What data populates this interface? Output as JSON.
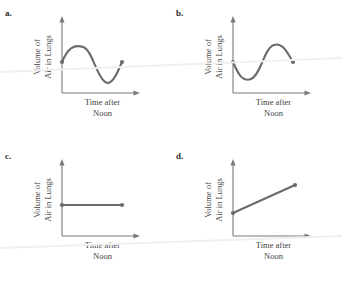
{
  "figure": {
    "background": "#ffffff",
    "stroke_color": "#6b6b6b",
    "axis_color": "#7a7a7a",
    "text_color": "#3f3f3f",
    "letter_color": "#2a2a2a",
    "artifact_color": "#f2f0ee"
  },
  "axis_labels": {
    "y_line1": "Volume of",
    "y_line2": "Air in Lungs",
    "x_line1": "Time after",
    "x_line2": "Noon"
  },
  "panels": [
    {
      "letter": "a.",
      "name": "panel-a",
      "curve_type": "sine-up-first",
      "description": "Curve starts at a dot on the vertical axis, rises to a peak, falls to a trough below the start level, then rises to an endpoint dot at the start level.",
      "start_point": {
        "x": 62,
        "y": 62
      },
      "end_point": {
        "x": 122,
        "y": 62
      },
      "path": "M62,62 C68,48 74,44 83,47 C92,50 95,72 104,81 C111,88 117,74 122,62"
    },
    {
      "letter": "b.",
      "name": "panel-b",
      "curve_type": "sine-down-first",
      "description": "Curve starts at a dot on the vertical axis, dips to a trough, rises to a peak above the start level, then falls to an endpoint dot at the start level.",
      "start_point": {
        "x": 62,
        "y": 62
      },
      "end_point": {
        "x": 122,
        "y": 62
      },
      "path": "M62,62 C68,76 72,82 80,79 C90,75 93,48 103,45 C112,42 117,54 122,62"
    },
    {
      "letter": "c.",
      "name": "panel-c",
      "curve_type": "constant",
      "description": "Horizontal straight segment at a constant height with dots at both ends.",
      "start_point": {
        "x": 62,
        "y": 62
      },
      "end_point": {
        "x": 122,
        "y": 62
      },
      "path": "M62,62 L122,62"
    },
    {
      "letter": "d.",
      "name": "panel-d",
      "curve_type": "increasing-linear",
      "description": "Straight segment rising from a dot on the vertical axis to a higher endpoint dot on the right.",
      "start_point": {
        "x": 62,
        "y": 70
      },
      "end_point": {
        "x": 124,
        "y": 42
      },
      "path": "M62,70 L124,42"
    }
  ],
  "axes": {
    "origin": {
      "x": 62,
      "y": 93
    },
    "y_top": 17,
    "x_right": 140
  }
}
